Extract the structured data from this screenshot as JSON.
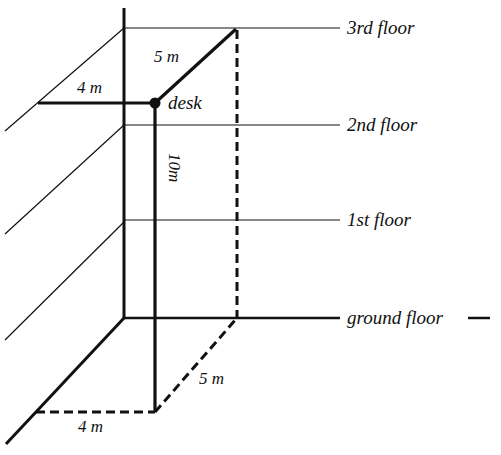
{
  "diagram": {
    "type": "3d-building-floors",
    "colors": {
      "line": "#111111",
      "background": "#ffffff"
    },
    "floors": [
      {
        "label": "3rd floor",
        "y": 28
      },
      {
        "label": "2nd floor",
        "y": 125
      },
      {
        "label": "1st floor",
        "y": 220
      },
      {
        "label": "ground floor",
        "y": 318
      }
    ],
    "point": {
      "label": "desk"
    },
    "dimensions": {
      "top_left": "4 m",
      "top_diag": "5 m",
      "vertical": "10m",
      "bottom_diag": "5 m",
      "bottom_left": "4 m"
    }
  }
}
